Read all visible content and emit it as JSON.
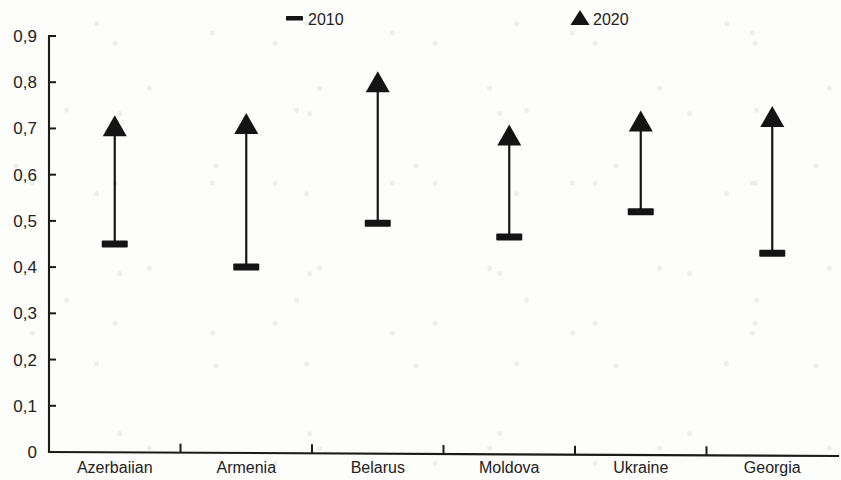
{
  "chart_data": {
    "type": "scatter",
    "title": "",
    "subtitle": "",
    "xlabel": "",
    "ylabel": "",
    "categories": [
      "Azerbaiian",
      "Armenia",
      "Belarus",
      "Moldova",
      "Ukraine",
      "Georgia"
    ],
    "series": [
      {
        "name": "2010",
        "marker": "dash",
        "values": [
          0.45,
          0.4,
          0.495,
          0.465,
          0.52,
          0.43
        ]
      },
      {
        "name": "2020",
        "marker": "triangle-up",
        "values": [
          0.705,
          0.71,
          0.8,
          0.685,
          0.715,
          0.725
        ]
      }
    ],
    "ylim": [
      0,
      0.9
    ],
    "ytick_values": [
      0,
      0.1,
      0.2,
      0.3,
      0.4,
      0.5,
      0.6,
      0.7,
      0.8,
      0.9
    ],
    "ytick_labels": [
      "0",
      "0,1",
      "0,2",
      "0,3",
      "0,4",
      "0,5",
      "0,6",
      "0,7",
      "0,8",
      "0,9"
    ],
    "decimal_separator": ",",
    "grid": false,
    "legend_position": "top",
    "connector": "arrow-from-2010-to-2020",
    "marker_color": "#141414",
    "axis_color": "#1b1b1b"
  },
  "legend": {
    "entries": [
      {
        "label": "2010",
        "marker": "dash"
      },
      {
        "label": "2020",
        "marker": "triangle-up"
      }
    ]
  }
}
